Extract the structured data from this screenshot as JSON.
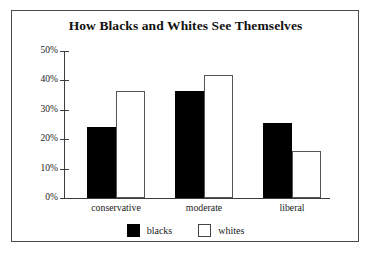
{
  "chart_data": {
    "type": "bar",
    "title": "How Blacks and Whites See Themselves",
    "xlabel": "",
    "ylabel": "",
    "categories": [
      "conservative",
      "moderate",
      "liberal"
    ],
    "series": [
      {
        "name": "blacks",
        "values": [
          24,
          36.5,
          25.5
        ],
        "color": "#000000",
        "style": "filled"
      },
      {
        "name": "whites",
        "values": [
          36.5,
          42,
          16
        ],
        "color": "#ffffff",
        "style": "outlined"
      }
    ],
    "ylim": [
      0,
      50
    ],
    "ytick_values": [
      0,
      10,
      20,
      30,
      40,
      50
    ],
    "ytick_labels": [
      "0%",
      "10%",
      "20%",
      "30%",
      "40%",
      "50%"
    ],
    "grid": false,
    "legend_position": "bottom",
    "value_suffix": "%"
  },
  "legend": {
    "items": [
      {
        "label": "blacks",
        "swatch": "filled-black-square"
      },
      {
        "label": "whites",
        "swatch": "outlined-white-square"
      }
    ]
  },
  "frame": {
    "border_color": "#4a4a4a",
    "background": "#ffffff"
  }
}
